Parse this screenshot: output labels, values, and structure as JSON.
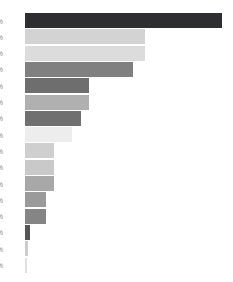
{
  "chart_data": {
    "type": "bar",
    "orientation": "horizontal",
    "title": "",
    "subtitle": "",
    "xlabel": "",
    "ylabel": "",
    "xlim": [
      0,
      100
    ],
    "grid": false,
    "legend": false,
    "legend_position": "none",
    "background_color": "#ffffff",
    "note": "Horizontal bar chart; category tick labels are clipped at the left image edge so only the tail sliver of each percent label is visible.",
    "categories": [
      "%",
      "%",
      "%",
      "%",
      "%",
      "%",
      "%",
      "%",
      "%",
      "%",
      "%",
      "%",
      "%",
      "%",
      "%",
      "%"
    ],
    "tick_labels": [
      "%",
      "%",
      "%",
      "%",
      "%",
      "%",
      "%",
      "%",
      "%",
      "%",
      "%",
      "%",
      "%",
      "%",
      "%",
      "%"
    ],
    "values": [
      100.0,
      61.0,
      61.0,
      55.0,
      32.5,
      32.5,
      28.5,
      24.0,
      14.5,
      14.5,
      14.5,
      10.5,
      10.5,
      2.5,
      1.5,
      1.0
    ],
    "bar_colors": [
      "#2e2e32",
      "#d3d3d3",
      "#dcdcdc",
      "#808080",
      "#6e6e6e",
      "#b0b0b0",
      "#707070",
      "#ededed",
      "#cfcfcf",
      "#c9c9c9",
      "#a8a8a8",
      "#9a9a9a",
      "#858585",
      "#555555",
      "#cccccc",
      "#e0e0e0"
    ],
    "series": [
      {
        "name": "",
        "values": [
          100.0,
          61.0,
          61.0,
          55.0,
          32.5,
          32.5,
          28.5,
          24.0,
          14.5,
          14.5,
          14.5,
          10.5,
          10.5,
          2.5,
          1.5,
          1.0
        ]
      }
    ]
  },
  "layout": {
    "bar_height_px": 15,
    "bar_pitch_px": 16.3,
    "plot_left_px": 25,
    "plot_top_px": 13,
    "plot_width_px": 197
  }
}
